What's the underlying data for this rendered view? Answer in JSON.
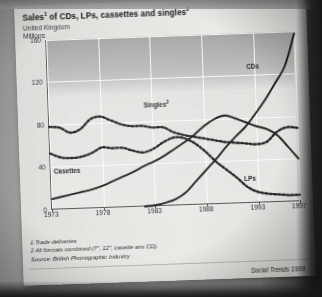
{
  "page": {
    "title_main": "Sales",
    "title_sup1": "1",
    "title_rest": " of CDs, LPs, cassettes and singles",
    "title_sup2": "2",
    "subtitle": "United Kingdom",
    "units": "Millions",
    "notes": [
      "1 Trade deliveries",
      "2 All formats combined (7\", 12\", casette ans CD).",
      "Source: British Phonographic Industry"
    ],
    "footer": "Social Trends 1999"
  },
  "chart_data": {
    "type": "line",
    "title": "Sales1 of CDs, LPs, cassettes and singles2",
    "subtitle": "United Kingdom",
    "xlabel": "",
    "ylabel": "Millions",
    "ylim": [
      0,
      160
    ],
    "xlim": [
      1973,
      1997
    ],
    "yticks": [
      0,
      40,
      80,
      120,
      160
    ],
    "xticks": [
      1973,
      1978,
      1983,
      1988,
      1993,
      1997
    ],
    "grid": "both",
    "legend": "inline-labels",
    "x": [
      1973,
      1974,
      1975,
      1976,
      1977,
      1978,
      1979,
      1980,
      1981,
      1982,
      1983,
      1984,
      1985,
      1986,
      1987,
      1988,
      1989,
      1990,
      1991,
      1992,
      1993,
      1994,
      1995,
      1996,
      1997
    ],
    "series": [
      {
        "name": "Singles",
        "label": "Singles2",
        "style": "dotted",
        "values": [
          78,
          77,
          72,
          75,
          84,
          86,
          82,
          78,
          76,
          76,
          74,
          74,
          69,
          66,
          64,
          62,
          60,
          58,
          57,
          56,
          55,
          57,
          66,
          70,
          69
        ]
      },
      {
        "name": "LPs",
        "label": "LPs",
        "style": "dotted",
        "values": [
          53,
          49,
          48,
          49,
          52,
          57,
          56,
          56,
          53,
          51,
          54,
          60,
          64,
          63,
          58,
          50,
          40,
          32,
          24,
          15,
          10,
          8,
          7,
          6,
          6
        ]
      },
      {
        "name": "Cassettes",
        "label": "Casettes",
        "style": "solid",
        "values": [
          10,
          12,
          14,
          16,
          18,
          21,
          25,
          29,
          33,
          38,
          42,
          47,
          53,
          59,
          66,
          74,
          80,
          83,
          80,
          76,
          72,
          69,
          63,
          52,
          40
        ]
      },
      {
        "name": "CDs",
        "label": "CDs",
        "style": "solid",
        "values": [
          0,
          0,
          0,
          0,
          0,
          0,
          0,
          0,
          0,
          0,
          1,
          3,
          6,
          12,
          22,
          32,
          42,
          53,
          63,
          72,
          84,
          97,
          112,
          128,
          158
        ]
      }
    ],
    "notes": [
      "1 Trade deliveries",
      "2 All formats combined (7\", 12\", casette ans CD).",
      "Source: British Phonographic Industry"
    ],
    "source": "British Phonographic Industry",
    "publication": "Social Trends 1999"
  }
}
